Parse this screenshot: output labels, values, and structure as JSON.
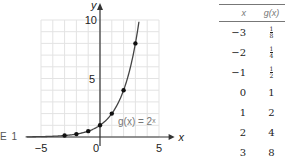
{
  "figure_label": "E 1",
  "chart_data": {
    "type": "line",
    "title": "",
    "function_label": "g(x) = 2ˣ",
    "xlabel": "x",
    "ylabel": "y",
    "xlim": [
      -5,
      5
    ],
    "ylim": [
      0,
      10
    ],
    "x_ticks": [
      "-5",
      "0",
      "5"
    ],
    "y_ticks": [
      "5",
      "10"
    ],
    "grid": true,
    "series": [
      {
        "name": "g(x) = 2^x",
        "curve": "exponential base 2",
        "points": [
          {
            "x": -3,
            "y": 0.125
          },
          {
            "x": -2,
            "y": 0.25
          },
          {
            "x": -1,
            "y": 0.5
          },
          {
            "x": 0,
            "y": 1
          },
          {
            "x": 1,
            "y": 2
          },
          {
            "x": 2,
            "y": 4
          },
          {
            "x": 3,
            "y": 8
          }
        ]
      }
    ]
  },
  "table": {
    "headers": [
      "x",
      "g(x)"
    ],
    "rows": [
      {
        "x": "−3",
        "g": "1/8",
        "num": "1",
        "den": "8",
        "fraction": true
      },
      {
        "x": "−2",
        "g": "1/4",
        "num": "1",
        "den": "4",
        "fraction": true
      },
      {
        "x": "−1",
        "g": "1/2",
        "num": "1",
        "den": "2",
        "fraction": true
      },
      {
        "x": "0",
        "g": "1"
      },
      {
        "x": "1",
        "g": "2"
      },
      {
        "x": "2",
        "g": "4"
      },
      {
        "x": "3",
        "g": "8"
      }
    ]
  }
}
